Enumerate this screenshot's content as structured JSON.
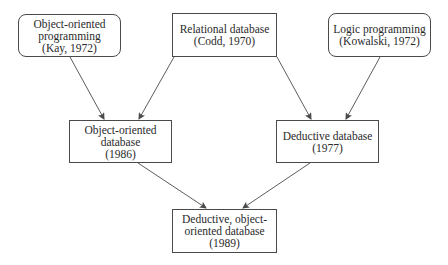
{
  "diagram": {
    "type": "lineage-graph",
    "nodes": [
      {
        "id": "oop",
        "shape": "rounded",
        "lines": [
          "Object-oriented",
          "programming",
          "(Kay, 1972)"
        ]
      },
      {
        "id": "reldb",
        "shape": "rect",
        "lines": [
          "Relational database",
          "(Codd, 1970)"
        ]
      },
      {
        "id": "logic",
        "shape": "rounded",
        "lines": [
          "Logic programming",
          "(Kowalski, 1972)"
        ]
      },
      {
        "id": "oodb",
        "shape": "rect",
        "lines": [
          "Object-oriented",
          "database",
          "(1986)"
        ]
      },
      {
        "id": "deddb",
        "shape": "rect",
        "lines": [
          "Deductive database",
          "(1977)"
        ]
      },
      {
        "id": "dooddb",
        "shape": "rect",
        "lines": [
          "Deductive, object-",
          "oriented database",
          "(1989)"
        ]
      }
    ],
    "edges": [
      {
        "from": "oop",
        "to": "oodb"
      },
      {
        "from": "reldb",
        "to": "oodb"
      },
      {
        "from": "reldb",
        "to": "deddb"
      },
      {
        "from": "logic",
        "to": "deddb"
      },
      {
        "from": "oodb",
        "to": "dooddb"
      },
      {
        "from": "deddb",
        "to": "dooddb"
      }
    ],
    "colors": {
      "stroke": "#4a4a4a",
      "text": "#2a2a2a",
      "background": "#ffffff"
    }
  }
}
